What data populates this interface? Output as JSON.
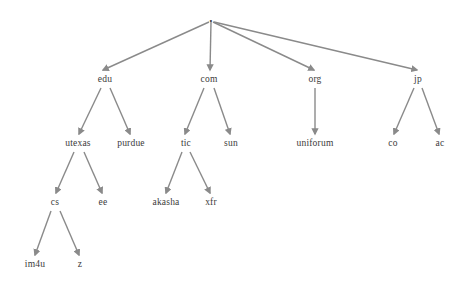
{
  "diagram": {
    "type": "tree",
    "background_color": "#ffffff",
    "edge_color": "#8a8a8a",
    "label_color": "#3a3a3a",
    "nodes": [
      {
        "id": "root",
        "label": ".",
        "x": 211,
        "y": 17,
        "level": 0
      },
      {
        "id": "edu",
        "label": "edu",
        "x": 105,
        "y": 80,
        "level": 1
      },
      {
        "id": "com",
        "label": "com",
        "x": 209,
        "y": 80,
        "level": 1
      },
      {
        "id": "org",
        "label": "org",
        "x": 315,
        "y": 80,
        "level": 1
      },
      {
        "id": "jp",
        "label": "jp",
        "x": 418,
        "y": 80,
        "level": 1
      },
      {
        "id": "utexas",
        "label": "utexas",
        "x": 78,
        "y": 144,
        "level": 2
      },
      {
        "id": "purdue",
        "label": "purdue",
        "x": 131,
        "y": 144,
        "level": 2
      },
      {
        "id": "tic",
        "label": "tic",
        "x": 186,
        "y": 144,
        "level": 2
      },
      {
        "id": "sun",
        "label": "sun",
        "x": 231,
        "y": 144,
        "level": 2
      },
      {
        "id": "uniforum",
        "label": "uniforum",
        "x": 315,
        "y": 144,
        "level": 2
      },
      {
        "id": "co",
        "label": "co",
        "x": 393,
        "y": 144,
        "level": 2
      },
      {
        "id": "ac",
        "label": "ac",
        "x": 440,
        "y": 144,
        "level": 2
      },
      {
        "id": "cs",
        "label": "cs",
        "x": 55,
        "y": 203,
        "level": 3
      },
      {
        "id": "ee",
        "label": "ee",
        "x": 103,
        "y": 203,
        "level": 3
      },
      {
        "id": "akasha",
        "label": "akasha",
        "x": 166,
        "y": 203,
        "level": 3
      },
      {
        "id": "xfr",
        "label": "xfr",
        "x": 211,
        "y": 203,
        "level": 3
      },
      {
        "id": "im4u",
        "label": "im4u",
        "x": 35,
        "y": 265,
        "level": 4
      },
      {
        "id": "z",
        "label": "z",
        "x": 80,
        "y": 265,
        "level": 4
      }
    ],
    "edges": [
      {
        "from": "root",
        "to": "edu",
        "x1": 209,
        "y1": 22,
        "x2": 103,
        "y2": 70
      },
      {
        "from": "root",
        "to": "com",
        "x1": 211,
        "y1": 22,
        "x2": 210,
        "y2": 70
      },
      {
        "from": "root",
        "to": "org",
        "x1": 213,
        "y1": 22,
        "x2": 314,
        "y2": 70
      },
      {
        "from": "root",
        "to": "jp",
        "x1": 214,
        "y1": 22,
        "x2": 417,
        "y2": 70
      },
      {
        "from": "edu",
        "to": "utexas",
        "x1": 101,
        "y1": 88,
        "x2": 79,
        "y2": 134
      },
      {
        "from": "edu",
        "to": "purdue",
        "x1": 110,
        "y1": 88,
        "x2": 130,
        "y2": 134
      },
      {
        "from": "com",
        "to": "tic",
        "x1": 204,
        "y1": 88,
        "x2": 185,
        "y2": 134
      },
      {
        "from": "com",
        "to": "sun",
        "x1": 214,
        "y1": 88,
        "x2": 230,
        "y2": 134
      },
      {
        "from": "org",
        "to": "uniforum",
        "x1": 315,
        "y1": 88,
        "x2": 315,
        "y2": 134
      },
      {
        "from": "jp",
        "to": "co",
        "x1": 414,
        "y1": 88,
        "x2": 394,
        "y2": 134
      },
      {
        "from": "jp",
        "to": "ac",
        "x1": 422,
        "y1": 88,
        "x2": 439,
        "y2": 134
      },
      {
        "from": "utexas",
        "to": "cs",
        "x1": 74,
        "y1": 152,
        "x2": 56,
        "y2": 193
      },
      {
        "from": "utexas",
        "to": "ee",
        "x1": 84,
        "y1": 152,
        "x2": 102,
        "y2": 193
      },
      {
        "from": "tic",
        "to": "akasha",
        "x1": 182,
        "y1": 152,
        "x2": 166,
        "y2": 193
      },
      {
        "from": "tic",
        "to": "xfr",
        "x1": 190,
        "y1": 152,
        "x2": 210,
        "y2": 193
      },
      {
        "from": "cs",
        "to": "im4u",
        "x1": 51,
        "y1": 211,
        "x2": 35,
        "y2": 255
      },
      {
        "from": "cs",
        "to": "z",
        "x1": 60,
        "y1": 211,
        "x2": 79,
        "y2": 255
      }
    ]
  }
}
